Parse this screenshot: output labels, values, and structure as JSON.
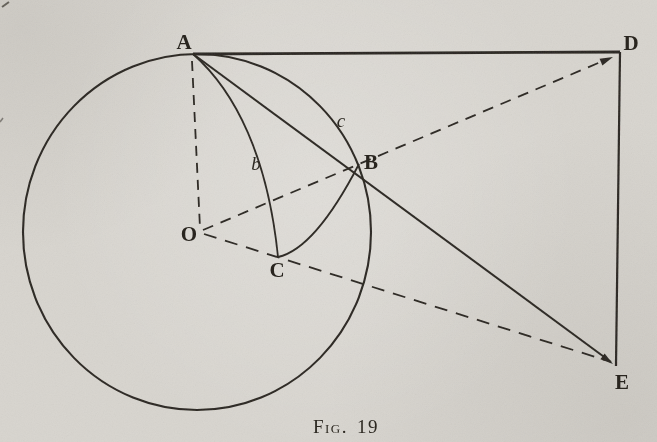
{
  "caption": {
    "label": "Fig.",
    "number": "19"
  },
  "points": {
    "A": "A",
    "B": "B",
    "C": "C",
    "D": "D",
    "E": "E",
    "O": "O"
  },
  "arc_labels": {
    "b": "b",
    "c": "c"
  },
  "colors": {
    "paper": "#d8d5cf",
    "ink": "#2a2620"
  }
}
